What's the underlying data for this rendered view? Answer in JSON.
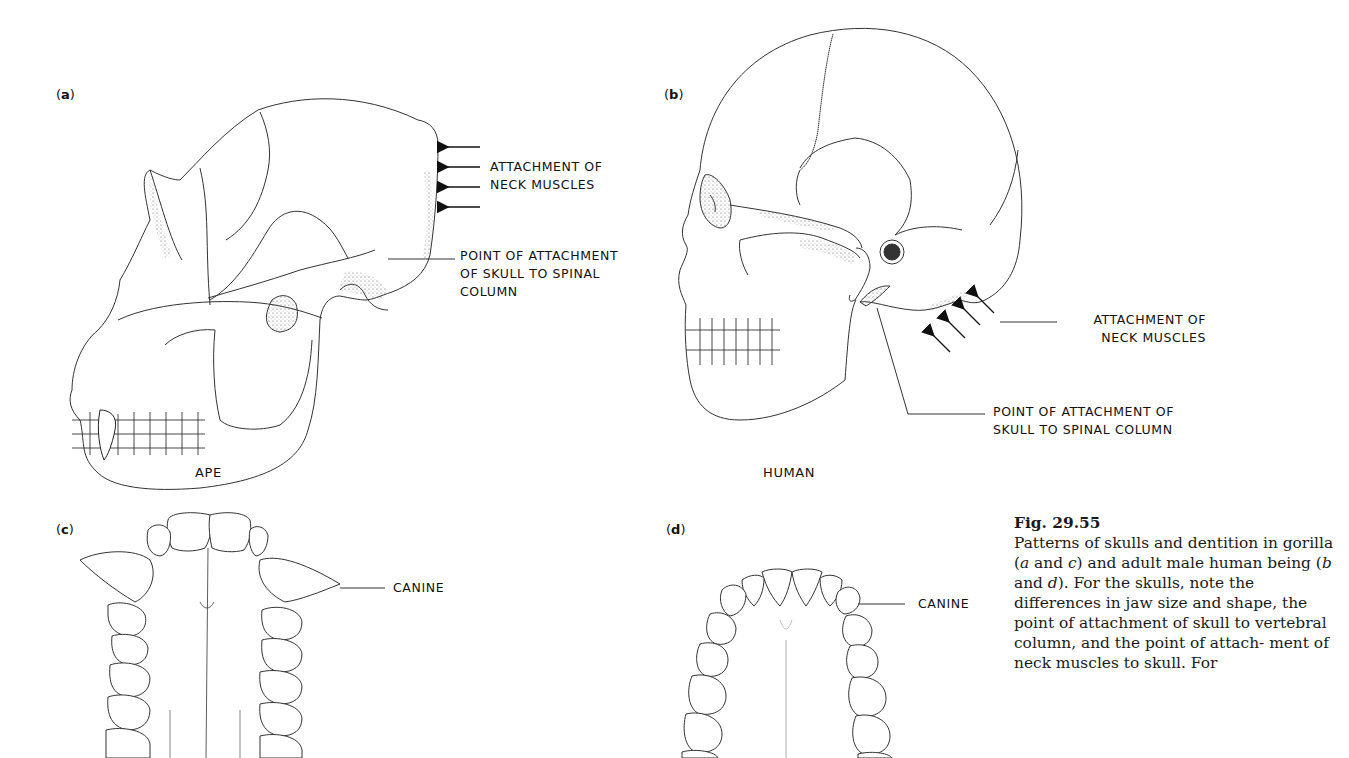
{
  "figure": {
    "number": "Fig. 29.55",
    "caption_parts": [
      "Patterns of skulls and dentition in gorilla (",
      "a",
      " and ",
      "c",
      ") and adult male human being (",
      "b",
      " and ",
      "d",
      "). For the skulls, note the differences in jaw size and shape, the point of attachment of skull to vertebral column, and the point of attach- ment of neck muscles to skull. For"
    ]
  },
  "panels": {
    "a": {
      "letter": "a",
      "species": "APE",
      "labels": {
        "neck_muscles_line1": "ATTACHMENT OF",
        "neck_muscles_line2": "NECK MUSCLES",
        "spinal_line1": "POINT OF ATTACHMENT",
        "spinal_line2": "OF SKULL TO SPINAL",
        "spinal_line3": "COLUMN"
      },
      "arrow_count": 4
    },
    "b": {
      "letter": "b",
      "species": "HUMAN",
      "labels": {
        "neck_muscles_line1": "ATTACHMENT OF",
        "neck_muscles_line2": "NECK MUSCLES",
        "spinal_line1": "POINT OF ATTACHMENT OF",
        "spinal_line2": "SKULL TO SPINAL COLUMN"
      },
      "arrow_count": 4
    },
    "c": {
      "letter": "c",
      "labels": {
        "canine": "CANINE"
      }
    },
    "d": {
      "letter": "d",
      "labels": {
        "canine": "CANINE"
      }
    }
  }
}
